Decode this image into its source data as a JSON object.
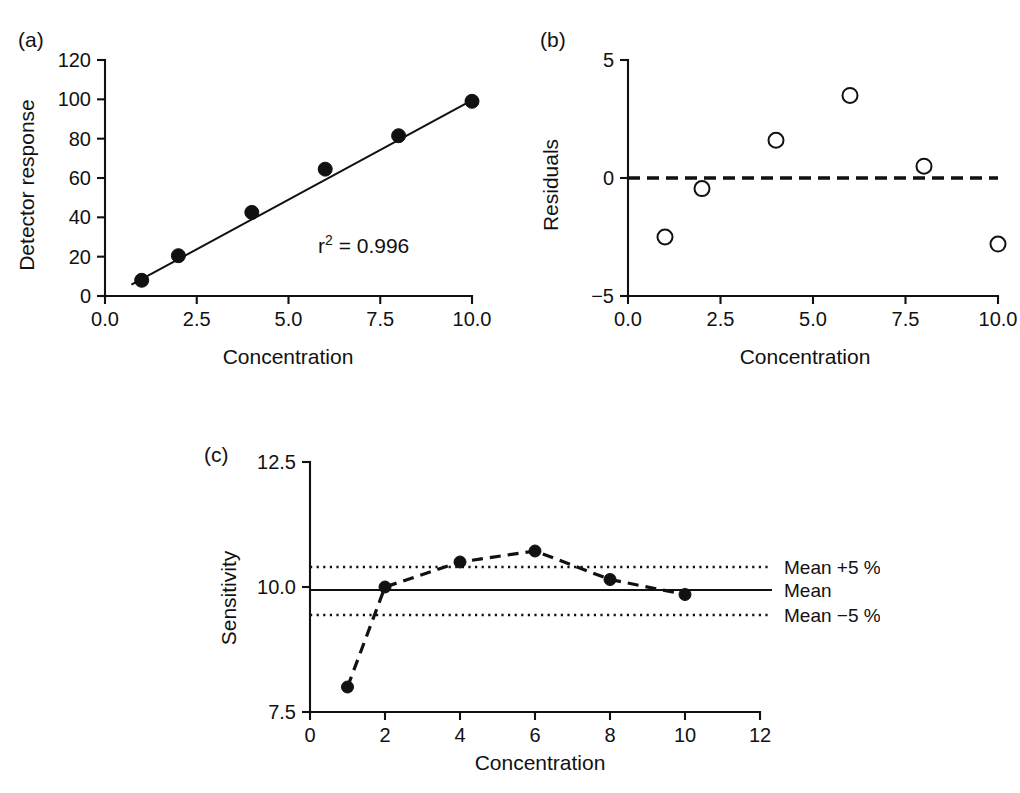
{
  "figure": {
    "background": "#ffffff",
    "ink": "#111111"
  },
  "panels": [
    {
      "id": "a",
      "label": "(a)",
      "xlabel": "Concentration",
      "ylabel": "Detector response",
      "annotation_prefix": "r",
      "annotation_sup": "2",
      "annotation_rest": " = 0.996"
    },
    {
      "id": "b",
      "label": "(b)",
      "xlabel": "Concentration",
      "ylabel": "Residuals"
    },
    {
      "id": "c",
      "label": "(c)",
      "xlabel": "Concentration",
      "ylabel": "Sensitivity",
      "ref_labels": {
        "upper": "Mean +5 %",
        "middle": "Mean",
        "lower": "Mean −5 %"
      }
    }
  ],
  "chart_data": [
    {
      "type": "scatter",
      "panel": "a",
      "title": "",
      "xlabel": "Concentration",
      "ylabel": "Detector response",
      "x": [
        1,
        2,
        4,
        6,
        8,
        10
      ],
      "values": [
        8,
        20.5,
        42.5,
        64.5,
        81.5,
        99
      ],
      "xlim": [
        0,
        10
      ],
      "ylim": [
        0,
        120
      ],
      "xticks": [
        0,
        2.5,
        5,
        7.5,
        10
      ],
      "xticklabels": [
        "0.0",
        "2.5",
        "5.0",
        "7.5",
        "10.0"
      ],
      "yticks": [
        0,
        20,
        40,
        60,
        80,
        100,
        120
      ],
      "yticklabels": [
        "0",
        "20",
        "40",
        "60",
        "80",
        "100",
        "120"
      ],
      "grid": false,
      "legend": "none",
      "marker": "filled-circle",
      "fit_line": {
        "intercept": -1.5,
        "slope": 10.1,
        "style": "solid"
      },
      "annotations": [
        {
          "text": "r2 = 0.996",
          "x": 6.2,
          "y": 30
        }
      ]
    },
    {
      "type": "scatter",
      "panel": "b",
      "title": "",
      "xlabel": "Concentration",
      "ylabel": "Residuals",
      "x": [
        1,
        2,
        4,
        6,
        8,
        10
      ],
      "values": [
        -2.5,
        -0.45,
        1.6,
        3.5,
        0.5,
        -2.8
      ],
      "xlim": [
        0,
        10
      ],
      "ylim": [
        -5,
        5
      ],
      "xticks": [
        0,
        2.5,
        5,
        7.5,
        10
      ],
      "xticklabels": [
        "0.0",
        "2.5",
        "5.0",
        "7.5",
        "10.0"
      ],
      "yticks": [
        -5,
        0,
        5
      ],
      "yticklabels": [
        "−5",
        "0",
        "5"
      ],
      "grid": false,
      "legend": "none",
      "marker": "open-circle",
      "reference_lines": [
        {
          "y": 0,
          "style": "dashed"
        }
      ]
    },
    {
      "type": "line",
      "panel": "c",
      "title": "",
      "xlabel": "Concentration",
      "ylabel": "Sensitivity",
      "x": [
        1,
        2,
        4,
        6,
        8,
        10
      ],
      "values": [
        8.0,
        10.0,
        10.5,
        10.72,
        10.15,
        9.85
      ],
      "xlim": [
        0,
        12
      ],
      "ylim": [
        7.5,
        12.5
      ],
      "xticks": [
        0,
        2,
        4,
        6,
        8,
        10,
        12
      ],
      "xticklabels": [
        "0",
        "2",
        "4",
        "6",
        "8",
        "10",
        "12"
      ],
      "yticks": [
        7.5,
        10.0,
        12.5
      ],
      "yticklabels": [
        "7.5",
        "10.0",
        "12.5"
      ],
      "grid": false,
      "legend": "right-inline",
      "marker": "filled-circle",
      "line_style": "dashed",
      "reference_lines": [
        {
          "label": "Mean +5 %",
          "y": 10.4,
          "style": "dotted"
        },
        {
          "label": "Mean",
          "y": 9.94,
          "style": "solid"
        },
        {
          "label": "Mean −5 %",
          "y": 9.44,
          "style": "dotted"
        }
      ]
    }
  ]
}
